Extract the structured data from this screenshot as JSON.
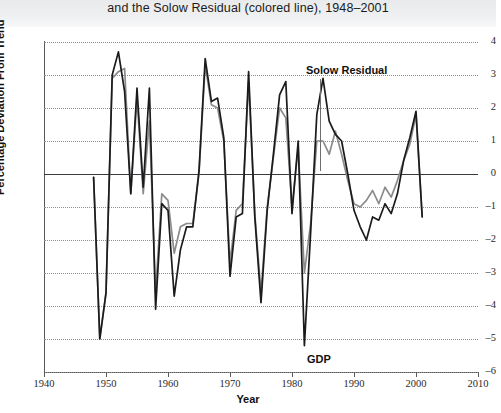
{
  "header": {
    "title": "and the Solow Residual (colored line), 1948–2001"
  },
  "axis": {
    "y_title": "Percentage Deviation From Trend",
    "x_title": "Year",
    "y_ticks": [
      "4",
      "3",
      "2",
      "1",
      "0",
      "–1",
      "–2",
      "–3",
      "–4",
      "–5",
      "–6"
    ],
    "x_ticks": [
      "1940",
      "1950",
      "1960",
      "1970",
      "1980",
      "1990",
      "2000",
      "2010"
    ]
  },
  "annotations": {
    "solow_label": "Solow Residual",
    "gdp_label": "GDP"
  },
  "colors": {
    "gdp_line": "#1b1b1d",
    "solow_line": "#8b8b8e",
    "grid": "#8d8d90",
    "axis": "#58585a",
    "zero_line": "#3a3a3c",
    "header_band": "#eceef0"
  },
  "chart_data": {
    "type": "line",
    "title": "and the Solow Residual (colored line), 1948–2001",
    "xlabel": "Year",
    "ylabel": "Percentage Deviation From Trend",
    "xlim": [
      1940,
      2010
    ],
    "ylim": [
      -6,
      4
    ],
    "grid": true,
    "legend_position": "inline-annotations",
    "x": [
      1948,
      1949,
      1950,
      1951,
      1952,
      1953,
      1954,
      1955,
      1956,
      1957,
      1958,
      1959,
      1960,
      1961,
      1962,
      1963,
      1964,
      1965,
      1966,
      1967,
      1968,
      1969,
      1970,
      1971,
      1972,
      1973,
      1974,
      1975,
      1976,
      1977,
      1978,
      1979,
      1980,
      1981,
      1982,
      1983,
      1984,
      1985,
      1986,
      1987,
      1988,
      1989,
      1990,
      1991,
      1992,
      1993,
      1994,
      1995,
      1996,
      1997,
      1998,
      1999,
      2000,
      2001
    ],
    "series": [
      {
        "name": "GDP",
        "color": "#1b1b1d",
        "values": [
          -0.1,
          -5.0,
          -3.6,
          3.0,
          3.7,
          2.5,
          -0.6,
          2.6,
          -0.4,
          2.6,
          -4.1,
          -0.9,
          -1.1,
          -3.7,
          -2.3,
          -1.6,
          -1.6,
          0.1,
          3.5,
          2.2,
          2.3,
          1.1,
          -3.1,
          -1.3,
          -1.2,
          3.1,
          -1.3,
          -3.9,
          -1.1,
          0.6,
          2.4,
          2.8,
          -1.2,
          1.0,
          -5.2,
          -1.8,
          1.8,
          2.9,
          1.6,
          1.2,
          1.0,
          0.0,
          -1.1,
          -1.6,
          -2.0,
          -1.3,
          -1.4,
          -0.9,
          -1.2,
          -0.6,
          0.4,
          1.1,
          1.9,
          -1.3
        ]
      },
      {
        "name": "Solow Residual",
        "color": "#8b8b8e",
        "values": [
          -0.1,
          -5.0,
          -3.6,
          2.9,
          3.1,
          3.2,
          -0.6,
          2.3,
          -0.6,
          1.6,
          -3.6,
          -0.6,
          -0.8,
          -2.4,
          -1.6,
          -1.5,
          -1.5,
          0.0,
          3.3,
          2.1,
          2.0,
          1.0,
          -2.7,
          -1.1,
          -0.9,
          2.8,
          -1.2,
          -3.6,
          -1.0,
          0.5,
          2.0,
          1.7,
          -1.0,
          0.8,
          -3.0,
          -1.5,
          1.0,
          1.0,
          0.6,
          1.3,
          0.6,
          -0.2,
          -0.9,
          -1.0,
          -0.8,
          -0.5,
          -0.9,
          -0.4,
          -0.7,
          -0.2,
          0.4,
          0.9,
          1.8,
          -1.3
        ]
      }
    ]
  }
}
